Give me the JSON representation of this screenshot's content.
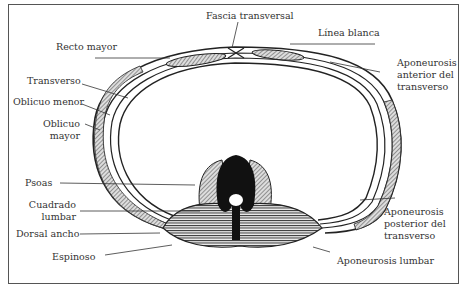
{
  "diagram": {
    "type": "anatomical cross-section",
    "labels": {
      "fascia_transversal": "Fascia transversal",
      "linea_blanca": "Línea blanca",
      "recto_mayor": "Recto mayor",
      "aponeurosis_anterior_1": "Aponeurosis",
      "aponeurosis_anterior_2": "anterior del",
      "aponeurosis_anterior_3": "transverso",
      "transverso": "Transverso",
      "oblicuo_menor": "Oblicuo menor",
      "oblicuo_mayor_1": "Oblicuo",
      "oblicuo_mayor_2": "mayor",
      "psoas": "Psoas",
      "cuadrado_lumbar_1": "Cuadrado",
      "cuadrado_lumbar_2": "lumbar",
      "dorsal_ancho": "Dorsal ancho",
      "espinoso": "Espinoso",
      "aponeurosis_posterior_1": "Aponeurosis",
      "aponeurosis_posterior_2": "posterior del",
      "aponeurosis_posterior_3": "transverso",
      "aponeurosis_lumbar": "Aponeurosis lumbar"
    }
  }
}
